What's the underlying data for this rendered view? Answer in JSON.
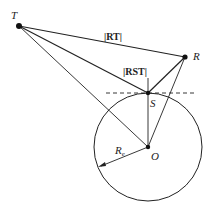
{
  "diagram": {
    "points": {
      "T": {
        "label": "T",
        "x": 19,
        "y": 26
      },
      "R": {
        "label": "R",
        "x": 185,
        "y": 57
      },
      "S": {
        "label": "S",
        "x": 148,
        "y": 93
      },
      "O": {
        "label": "O",
        "x": 148,
        "y": 147
      }
    },
    "circle": {
      "cx": 148,
      "cy": 147,
      "r": 54
    },
    "labels": {
      "rt": "|RT|",
      "rst": "|RST|",
      "radius": "R",
      "radius_sub": "e",
      "T": "T",
      "R": "R",
      "S": "S",
      "O": "O"
    },
    "colors": {
      "stroke": "#222222",
      "background": "#ffffff"
    }
  }
}
